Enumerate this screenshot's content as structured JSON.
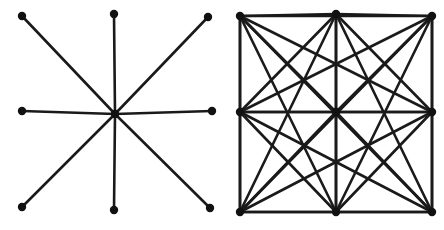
{
  "figure": {
    "background_color": "#ffffff",
    "edge_color": "#1a1a1a",
    "node_color": "#111111",
    "edge_width": 2.6,
    "node_radius": 4.2,
    "canvas": {
      "width": 444,
      "height": 230
    }
  },
  "panels": [
    {
      "id": "left-panel",
      "name": "star-graph",
      "label": "",
      "graph_type": "star",
      "node_count": 9,
      "edge_count": 8,
      "nodes": [
        {
          "id": "tl",
          "label": "",
          "x": 22,
          "y": 16
        },
        {
          "id": "tc",
          "label": "",
          "x": 114,
          "y": 14
        },
        {
          "id": "tr",
          "label": "",
          "x": 208,
          "y": 17
        },
        {
          "id": "ml",
          "label": "",
          "x": 22,
          "y": 111
        },
        {
          "id": "cc",
          "label": "",
          "x": 115,
          "y": 114
        },
        {
          "id": "mr",
          "label": "",
          "x": 212,
          "y": 111
        },
        {
          "id": "bl",
          "label": "",
          "x": 22,
          "y": 207
        },
        {
          "id": "bc",
          "label": "",
          "x": 114,
          "y": 210
        },
        {
          "id": "br",
          "label": "",
          "x": 210,
          "y": 208
        }
      ],
      "edges": [
        [
          "cc",
          "tl"
        ],
        [
          "cc",
          "tc"
        ],
        [
          "cc",
          "tr"
        ],
        [
          "cc",
          "ml"
        ],
        [
          "cc",
          "mr"
        ],
        [
          "cc",
          "bl"
        ],
        [
          "cc",
          "bc"
        ],
        [
          "cc",
          "br"
        ]
      ]
    },
    {
      "id": "right-panel",
      "name": "complete-graph",
      "label": "",
      "graph_type": "complete",
      "node_count": 9,
      "edge_count": 36,
      "nodes": [
        {
          "id": "tl",
          "label": "",
          "x": 240,
          "y": 16
        },
        {
          "id": "tc",
          "label": "",
          "x": 336,
          "y": 14
        },
        {
          "id": "tr",
          "label": "",
          "x": 432,
          "y": 16
        },
        {
          "id": "ml",
          "label": "",
          "x": 240,
          "y": 112
        },
        {
          "id": "cc",
          "label": "",
          "x": 336,
          "y": 112
        },
        {
          "id": "mr",
          "label": "",
          "x": 432,
          "y": 112
        },
        {
          "id": "bl",
          "label": "",
          "x": 240,
          "y": 212
        },
        {
          "id": "bc",
          "label": "",
          "x": 336,
          "y": 212
        },
        {
          "id": "br",
          "label": "",
          "x": 432,
          "y": 212
        }
      ],
      "edges": [
        [
          "tl",
          "tc"
        ],
        [
          "tl",
          "tr"
        ],
        [
          "tl",
          "ml"
        ],
        [
          "tl",
          "cc"
        ],
        [
          "tl",
          "mr"
        ],
        [
          "tl",
          "bl"
        ],
        [
          "tl",
          "bc"
        ],
        [
          "tl",
          "br"
        ],
        [
          "tc",
          "tr"
        ],
        [
          "tc",
          "ml"
        ],
        [
          "tc",
          "cc"
        ],
        [
          "tc",
          "mr"
        ],
        [
          "tc",
          "bl"
        ],
        [
          "tc",
          "bc"
        ],
        [
          "tc",
          "br"
        ],
        [
          "tr",
          "ml"
        ],
        [
          "tr",
          "cc"
        ],
        [
          "tr",
          "mr"
        ],
        [
          "tr",
          "bl"
        ],
        [
          "tr",
          "bc"
        ],
        [
          "tr",
          "br"
        ],
        [
          "ml",
          "cc"
        ],
        [
          "ml",
          "mr"
        ],
        [
          "ml",
          "bl"
        ],
        [
          "ml",
          "bc"
        ],
        [
          "ml",
          "br"
        ],
        [
          "cc",
          "mr"
        ],
        [
          "cc",
          "bl"
        ],
        [
          "cc",
          "bc"
        ],
        [
          "cc",
          "br"
        ],
        [
          "mr",
          "bl"
        ],
        [
          "mr",
          "bc"
        ],
        [
          "mr",
          "br"
        ],
        [
          "bl",
          "bc"
        ],
        [
          "bl",
          "br"
        ],
        [
          "bc",
          "br"
        ]
      ]
    }
  ]
}
